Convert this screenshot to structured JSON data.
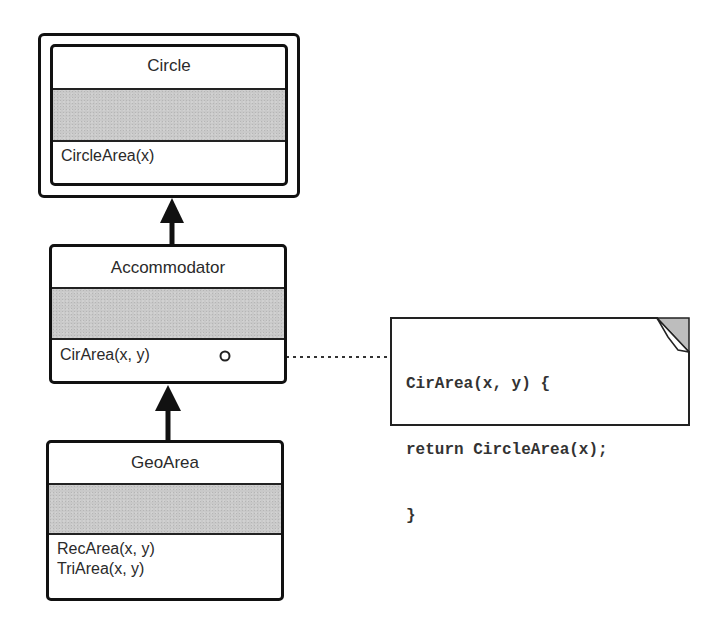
{
  "diagram": {
    "type": "UML class diagram (adapter pattern)",
    "classes": [
      {
        "id": "circle",
        "name": "Circle",
        "attributes": [],
        "operations": [
          "CircleArea(x)"
        ],
        "double_border": true
      },
      {
        "id": "accommodator",
        "name": "Accommodator",
        "attributes": [],
        "operations": [
          "CirArea(x, y)"
        ]
      },
      {
        "id": "geoarea",
        "name": "GeoArea",
        "attributes": [],
        "operations": [
          "RecArea(x, y)",
          "TriArea(x, y)"
        ]
      }
    ],
    "relations": [
      {
        "from": "accommodator",
        "to": "circle",
        "type": "generalization-arrow"
      },
      {
        "from": "geoarea",
        "to": "accommodator",
        "type": "generalization-arrow"
      },
      {
        "from": "accommodator.CirArea",
        "to": "note",
        "type": "dotted-note-link"
      }
    ],
    "note": {
      "lines": [
        "CirArea(x, y) {",
        "return CircleArea(x);",
        "}"
      ]
    }
  },
  "colors": {
    "line": "#111111",
    "attr_fill": "#c9c9c9",
    "background": "#ffffff"
  }
}
